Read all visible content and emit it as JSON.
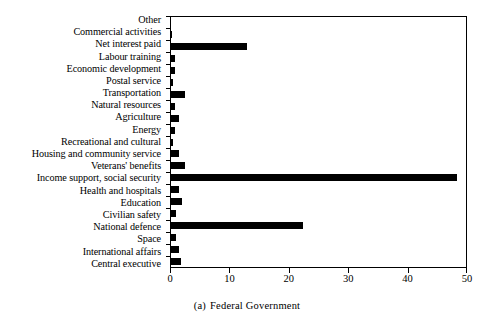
{
  "figure": {
    "caption_index": "(a)",
    "caption_text": "Federal Government"
  },
  "axis": {
    "x_ticks": [
      "0",
      "10",
      "20",
      "30",
      "40",
      "50"
    ],
    "x_min": 0,
    "x_max": 50
  },
  "chart_data": {
    "type": "bar",
    "orientation": "horizontal",
    "xlabel": "",
    "ylabel": "",
    "xlim": [
      0,
      50
    ],
    "xticks": [
      0,
      10,
      20,
      30,
      40,
      50
    ],
    "grid": false,
    "legend": null,
    "bar_color": "#000000",
    "categories": [
      "Other",
      "Commercial activities",
      "Net interest paid",
      "Labour training",
      "Economic development",
      "Postal service",
      "Transportation",
      "Natural resources",
      "Agriculture",
      "Energy",
      "Recreational and cultural",
      "Housing and community service",
      "Veterans' benefits",
      "Income support, social security",
      "Health and hospitals",
      "Education",
      "Civilian safety",
      "National defence",
      "Space",
      "International affairs",
      "Central executive"
    ],
    "values": [
      0.0,
      0.1,
      12.8,
      0.6,
      0.6,
      0.3,
      2.4,
      0.7,
      1.4,
      0.7,
      0.3,
      1.3,
      2.3,
      48.1,
      1.4,
      1.8,
      0.8,
      22.2,
      0.9,
      1.4,
      1.6
    ]
  }
}
